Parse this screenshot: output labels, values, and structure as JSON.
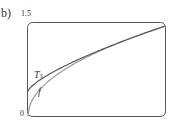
{
  "panel": {
    "label": "b)"
  },
  "chart_data": {
    "type": "line",
    "title": "",
    "xlabel": "",
    "ylabel": "",
    "ylim": [
      0,
      1.5
    ],
    "y_ticks": [
      "0",
      "1.5"
    ],
    "grid": false,
    "legend": "inline labels",
    "series": [
      {
        "name": "T3",
        "label": "T",
        "subscript": "3",
        "x": [
          0,
          0.1,
          0.25,
          0.5,
          0.75,
          1.0
        ],
        "values": [
          0.4,
          0.62,
          0.82,
          1.08,
          1.28,
          1.45
        ]
      },
      {
        "name": "f",
        "label": "f",
        "x": [
          0,
          0.02,
          0.1,
          0.25,
          0.5,
          0.75,
          1.0
        ],
        "values": [
          0.0,
          0.3,
          0.58,
          0.8,
          1.08,
          1.28,
          1.45
        ]
      }
    ],
    "colors": {
      "T3": "#555555",
      "f": "#999999",
      "frame": "#555555"
    }
  }
}
